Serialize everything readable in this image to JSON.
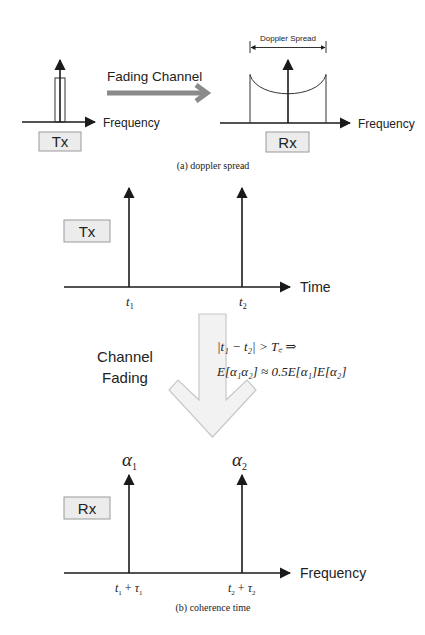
{
  "panel_a": {
    "caption": "(a) doppler spread",
    "tx": {
      "label": "Tx",
      "axis_label": "Frequency"
    },
    "channel": {
      "label": "Fading Channel",
      "arrow_color": "#8a8a8a"
    },
    "rx": {
      "label": "Rx",
      "axis_label": "Frequency",
      "spread_label": "Doppler Spread"
    }
  },
  "panel_b": {
    "caption": "(b) coherence time",
    "tx": {
      "label": "Tx",
      "axis_label": "Time",
      "ticks": [
        {
          "base": "t",
          "sub": "1"
        },
        {
          "base": "t",
          "sub": "2"
        }
      ]
    },
    "channel": {
      "label_line1": "Channel",
      "label_line2": "Fading",
      "arrow_fill": "#f2f2f2",
      "arrow_stroke": "#c8c8c8",
      "formula_line1": "|t₁ − t₂| > T꜀ ⇒",
      "formula_line2": "E[α₁α₂] ≈ 0.5E[α₁]E[α₂]"
    },
    "rx": {
      "label": "Rx",
      "axis_label": "Frequency",
      "amplitudes": [
        {
          "base": "α",
          "sub": "1"
        },
        {
          "base": "α",
          "sub": "2"
        }
      ],
      "ticks": [
        {
          "t": "t",
          "t_sub": "1",
          "op": "+",
          "tau": "τ",
          "tau_sub": "1"
        },
        {
          "t": "t",
          "t_sub": "2",
          "op": "+",
          "tau": "τ",
          "tau_sub": "2"
        }
      ]
    }
  }
}
